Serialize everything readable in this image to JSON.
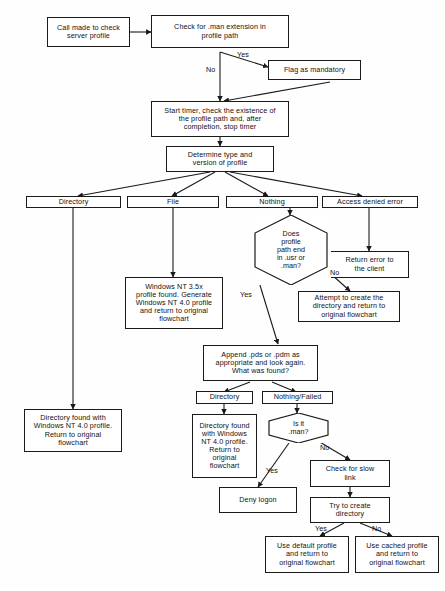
{
  "diagram": {
    "stroke_color": "#1a1a1a",
    "fill_color": "#ffffff",
    "background": "#fefefe"
  },
  "nodes": {
    "call_made": "Call made to check\nserver profile",
    "check_man_ext": "Check for .man extension in\nprofile path",
    "flag_mandatory": "Flag as mandatory",
    "start_timer": "Start timer, check the existence of\nthe profile path and, after\ncompletion, stop timer",
    "determine_type": "Determine type and\nversion of profile",
    "result_directory": "Directory",
    "result_file": "File",
    "result_nothing": "Nothing",
    "result_access_denied": "Access denied error",
    "return_error": "Return error to\nthe client",
    "hex_path_end": "Does\nprofile\npath end\nin .usr or\n.man?",
    "attempt_create": "Attempt to create the\ndirectory and return to\noriginal flowchart",
    "nt35_profile": "Windows NT 3.5x\nprofile found. Generate\nWindows NT 4.0 profile\nand return to original\nflowchart",
    "dir_found_nt40": "Directory found with\nWindows NT 4.0 profile.\nReturn to original\nflowchart",
    "append_pds": "Append .pds or .pdm as\nappropriate and look again.\nWhat was found?",
    "found_directory": "Directory",
    "found_nothing_failed": "Nothing/Failed",
    "dir_found_nt40_b": "Directory found\nwith Windows\nNT 4.0 profile.\nReturn to\noriginal\nflowchart",
    "hex_is_man": "Is it\n.man?",
    "deny_logon": "Deny logon",
    "check_slow_link": "Check for slow\nlink",
    "try_create_dir": "Try to create\ndirectory",
    "use_default_profile": "Use default profile\nand return to\noriginal flowchart",
    "use_cached_profile": "Use cached profile\nand return to\noriginal flowchart"
  },
  "edge_labels": {
    "man_yes": "Yes",
    "man_no": "No",
    "path_end_yes": "Yes",
    "path_end_no": "No",
    "is_man_yes": "Yes",
    "is_man_no": "No",
    "create_yes": "Yes",
    "create_no": "No"
  }
}
